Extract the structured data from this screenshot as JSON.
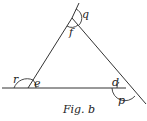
{
  "figure": {
    "caption": "Fig. b",
    "shape": "triangle with extended sides forming exterior angles",
    "labels": {
      "top_exterior": "q",
      "top_interior": "f",
      "left_exterior": "r",
      "left_interior": "e",
      "right_interior": "d",
      "right_exterior": "p"
    },
    "stroke_color": "#333333",
    "background": "#ffffff"
  }
}
